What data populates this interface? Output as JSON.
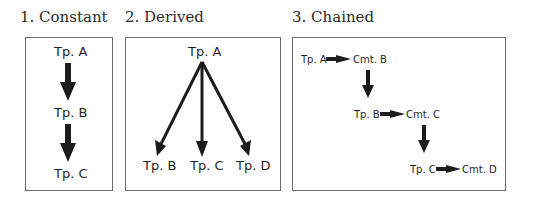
{
  "panels": [
    {
      "title": "1. Constant",
      "nodes": [
        "Tp. A",
        "Tp. B",
        "Tp. C"
      ]
    },
    {
      "title": "2. Derived",
      "root": "Tp. A",
      "children": [
        "Tp. B",
        "Tp. C",
        "Tp. D"
      ]
    },
    {
      "title": "3. Chained",
      "rows": [
        {
          "topic": "Tp. A",
          "comment": "Cmt. B"
        },
        {
          "topic": "Tp. B",
          "comment": "Cmt. C"
        },
        {
          "topic": "Tp. C",
          "comment": "Cmt. D"
        }
      ]
    }
  ],
  "colors": {
    "arrow": "#1c1c1c",
    "border": "#6b6b6b",
    "text": "#1f1f1f"
  }
}
